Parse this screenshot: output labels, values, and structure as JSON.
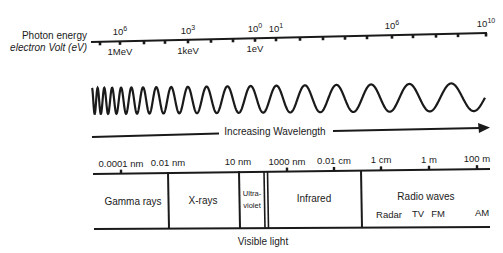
{
  "diagram": {
    "energy_axis": {
      "label_line1": "Photon energy",
      "label_line2": "electron Volt (eV)",
      "power_labels": [
        {
          "base": "10",
          "exp": "6",
          "x": 120
        },
        {
          "base": "10",
          "exp": "3",
          "x": 188
        },
        {
          "base": "10",
          "exp": "0",
          "x": 255
        },
        {
          "base": "10",
          "exp": "1",
          "x": 276
        },
        {
          "base": "10",
          "exp": "6",
          "x": 392
        },
        {
          "base": "10",
          "exp": "10",
          "x": 486
        }
      ],
      "unit_labels": [
        {
          "text": "1MeV",
          "x": 120
        },
        {
          "text": "1keV",
          "x": 188
        },
        {
          "text": "1eV",
          "x": 255
        }
      ]
    },
    "wave": {
      "arrow_label": "Increasing Wavelength"
    },
    "wavelength_axis": {
      "labels": [
        {
          "text": "0.0001 nm",
          "x": 121
        },
        {
          "text": "0.01 nm",
          "x": 168
        },
        {
          "text": "10 nm",
          "x": 238
        },
        {
          "text": "1000 nm",
          "x": 287
        },
        {
          "text": "0.01 cm",
          "x": 334
        },
        {
          "text": "1 cm",
          "x": 381
        },
        {
          "text": "1 m",
          "x": 429
        },
        {
          "text": "100 m",
          "x": 477
        }
      ]
    },
    "bands": [
      {
        "name": "Gamma rays"
      },
      {
        "name": "X-rays"
      },
      {
        "name": "Ultra-",
        "name2": "violet"
      },
      {
        "name": "Infrared"
      },
      {
        "name": "Radio waves"
      }
    ],
    "radio_subbands": [
      "Radar",
      "TV",
      "FM",
      "AM"
    ],
    "visible_label": "Visible light",
    "colors": {
      "ink": "#1a1a1a",
      "background": "#ffffff"
    }
  }
}
